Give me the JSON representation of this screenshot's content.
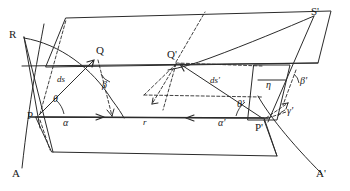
{
  "figure": {
    "type": "geometry-diagram",
    "stroke_color": "#2b2b2b",
    "background_color": "#ffffff"
  },
  "points": {
    "P": {
      "label": "P",
      "x": 36,
      "y": 116
    },
    "Q": {
      "label": "Q",
      "x": 99,
      "y": 56
    },
    "R": {
      "label": "R",
      "x": 13,
      "y": 36
    },
    "A": {
      "label": "A",
      "x": 16,
      "y": 176
    },
    "Pp": {
      "label": "P'",
      "x": 264,
      "y": 122
    },
    "Qp": {
      "label": "Q'",
      "x": 172,
      "y": 60
    },
    "Sp": {
      "label": "S'",
      "x": 315,
      "y": 13
    },
    "Ap": {
      "label": "A'",
      "x": 325,
      "y": 178
    }
  },
  "angles": {
    "theta": {
      "label": "θ",
      "x": 56,
      "y": 100
    },
    "alpha": {
      "label": "α",
      "x": 66,
      "y": 122
    },
    "beta": {
      "label": "β",
      "x": 105,
      "y": 88
    },
    "theta_p": {
      "label": "θ'",
      "x": 241,
      "y": 105
    },
    "alpha_p": {
      "label": "α'",
      "x": 222,
      "y": 122
    },
    "beta_p": {
      "label": "β'",
      "x": 300,
      "y": 84
    },
    "gamma_p": {
      "label": "γ'",
      "x": 288,
      "y": 112
    },
    "eta": {
      "label": "η",
      "x": 270,
      "y": 85
    }
  },
  "segments": {
    "ds": {
      "label": "ds",
      "x": 62,
      "y": 82
    },
    "ds_p": {
      "label": "ds'",
      "x": 214,
      "y": 83
    },
    "r": {
      "label": "r",
      "x": 145,
      "y": 119
    }
  },
  "geometry": {
    "plane_upper": "M 64,18 L 330,12 L 318,64 L 46,68 Z",
    "plane_lower": "M 38,117 L 263,118 L 275,155 L 52,152 Z",
    "baseline": "M 36,117 L 264,118",
    "note": "Solid outlines are the tangent plane quadrilaterals; dashed lines are projection/construction rays; smooth curves are spherical geodesic arcs."
  }
}
